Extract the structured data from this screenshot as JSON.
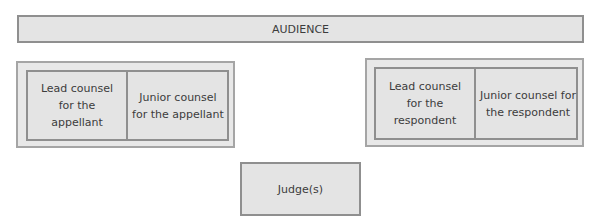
{
  "diagram": {
    "audience": {
      "label": "AUDIENCE"
    },
    "appellant_group": {
      "lead": "Lead counsel for the appellant",
      "junior": "Junior counsel for the appellant"
    },
    "respondent_group": {
      "lead": "Lead counsel for the respondent",
      "junior": "Junior counsel for the respondent"
    },
    "judge": {
      "label": "Judge(s)"
    }
  },
  "colors": {
    "box_fill": "#e4e4e4",
    "box_border": "#8f8f8f",
    "text": "#3c3c3c"
  }
}
